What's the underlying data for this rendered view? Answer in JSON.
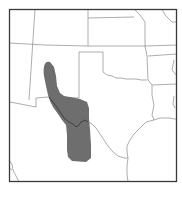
{
  "map": {
    "type": "range-map",
    "region": "Southwestern United States and northern Mexico",
    "colors": {
      "background": "#ffffff",
      "frame": "#3a3a3a",
      "borders": "#8a8a8a",
      "range_fill": "#6e6e6e",
      "river": "#4a4a4a"
    },
    "legend": [],
    "labels": []
  }
}
